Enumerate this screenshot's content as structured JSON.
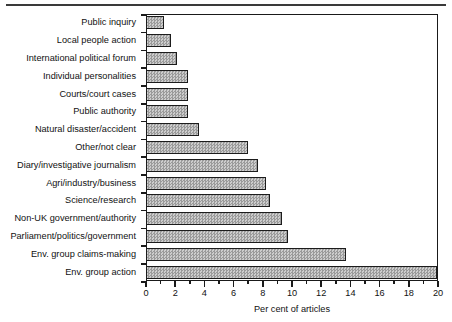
{
  "chart_data": {
    "type": "bar",
    "orientation": "horizontal",
    "title": "",
    "xlabel": "Per cent of articles",
    "ylabel": "",
    "xlim": [
      0,
      20
    ],
    "xticks": [
      0,
      2,
      4,
      6,
      8,
      10,
      12,
      14,
      16,
      18,
      20
    ],
    "xticklabels": [
      "0",
      "2",
      "4",
      "6",
      "8",
      "10",
      "12",
      "14",
      "16",
      "18",
      "20"
    ],
    "minor_tick_step": 1,
    "grid": false,
    "legend": null,
    "categories": [
      "Public inquiry",
      "Local people action",
      "International political forum",
      "Individual personalities",
      "Courts/court cases",
      "Public authority",
      "Natural disaster/accident",
      "Other/not clear",
      "Diary/investigative journalism",
      "Agri/industry/business",
      "Science/research",
      "Non-UK government/authority",
      "Parliament/politics/government",
      "Env. group claims-making",
      "Env. group action"
    ],
    "values": [
      1.2,
      1.7,
      2.1,
      2.9,
      2.9,
      2.9,
      3.6,
      7.0,
      7.7,
      8.2,
      8.5,
      9.3,
      9.7,
      13.7,
      19.9
    ],
    "bar_fill": "#b0b0b0",
    "bar_edge": "#1c1c1c",
    "frame_color": "#1a1a1a",
    "background": "#ffffff"
  }
}
